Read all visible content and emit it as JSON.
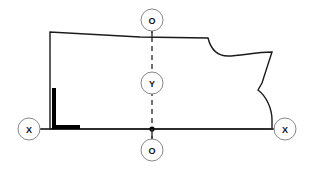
{
  "canvas": {
    "width": 312,
    "height": 170,
    "background": "#ffffff"
  },
  "style": {
    "outline_color": "#1a1a1a",
    "outline_width": 1.4,
    "axis_color": "#333333",
    "axis_width": 1.4,
    "dash_color": "#333333",
    "dash_pattern": "5 4",
    "marker_circle_fill": "#ffffff",
    "marker_circle_stroke": "#888888",
    "marker_text_color": "#111111",
    "corner_marker_color": "#000000",
    "origin_dot_color": "#000000"
  },
  "diagram": {
    "shape_name": "pattern-piece-outline",
    "outline_path": "M 50 32 L 50 129 L 272 129 L 272 120 C 272 108 266 96 258 90 L 262 83 L 272 52 C 256 52 240 56 228 56 C 218 56 211 50 208 38 L 140 37 Z",
    "outline_closed": true
  },
  "axes": {
    "vertical": {
      "name": "grainline-vertical",
      "x": 152,
      "y_top": 28,
      "y_bottom": 158,
      "style": "dashed"
    },
    "horizontal": {
      "name": "baseline-horizontal",
      "y": 129,
      "x_left": 18,
      "x_right": 294,
      "style": "solid"
    }
  },
  "origin_point": {
    "name": "axis-origin",
    "x": 152,
    "y": 129,
    "radius": 2.6
  },
  "corner_marker": {
    "name": "square-corner-marker",
    "vertical": {
      "x": 52,
      "y": 88,
      "width": 4,
      "height": 41
    },
    "horizontal": {
      "x": 52,
      "y": 125,
      "width": 28,
      "height": 4
    }
  },
  "markers": [
    {
      "id": "marker-o-top",
      "label": "O",
      "name": "axis-marker-o-top",
      "cx": 152,
      "cy": 20,
      "r": 11,
      "leader": {
        "x1": 152,
        "y1": 31,
        "x2": 152,
        "y2": 37
      }
    },
    {
      "id": "marker-y-middle",
      "label": "Y",
      "name": "axis-marker-y-middle",
      "cx": 152,
      "cy": 83,
      "r": 11,
      "leader": null
    },
    {
      "id": "marker-o-bottom",
      "label": "O",
      "name": "axis-marker-o-bottom",
      "cx": 152,
      "cy": 150,
      "r": 11,
      "leader": {
        "x1": 152,
        "y1": 129,
        "x2": 152,
        "y2": 139
      }
    },
    {
      "id": "marker-x-left",
      "label": "X",
      "name": "axis-marker-x-left",
      "cx": 29,
      "cy": 129,
      "r": 11,
      "leader": {
        "x1": 40,
        "y1": 129,
        "x2": 50,
        "y2": 129
      }
    },
    {
      "id": "marker-x-right",
      "label": "X",
      "name": "axis-marker-x-right",
      "cx": 285,
      "cy": 129,
      "r": 11,
      "leader": {
        "x1": 274,
        "y1": 129,
        "x2": 264,
        "y2": 129
      }
    }
  ]
}
